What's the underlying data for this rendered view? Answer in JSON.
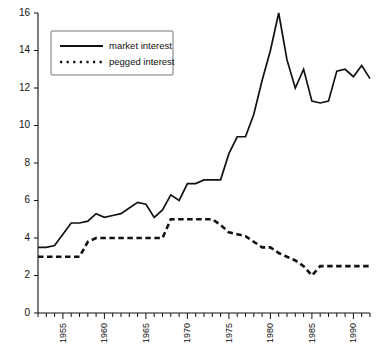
{
  "chart_data": {
    "type": "line",
    "title": "",
    "xlabel": "",
    "ylabel": "",
    "xlim": [
      1952,
      1992
    ],
    "ylim": [
      0,
      16
    ],
    "grid": false,
    "legend_position": "top-left",
    "y_ticks": [
      0,
      2,
      4,
      6,
      8,
      10,
      12,
      14,
      16
    ],
    "y_tick_labels": [
      "0",
      "2",
      "4",
      "6",
      "8",
      "10",
      "12",
      "14",
      "16"
    ],
    "x_tick_labels": [
      "1955",
      "1960",
      "1965",
      "1970",
      "1975",
      "1980",
      "1985",
      "1990"
    ],
    "x_tick_label_years": [
      1955,
      1960,
      1965,
      1970,
      1975,
      1980,
      1985,
      1990
    ],
    "x_minor_tick_years": [
      1952,
      1953,
      1954,
      1955,
      1956,
      1957,
      1958,
      1959,
      1960,
      1961,
      1962,
      1963,
      1964,
      1965,
      1966,
      1967,
      1968,
      1969,
      1970,
      1971,
      1972,
      1973,
      1974,
      1975,
      1976,
      1977,
      1978,
      1979,
      1980,
      1981,
      1982,
      1983,
      1984,
      1985,
      1986,
      1987,
      1988,
      1989,
      1990,
      1991,
      1992
    ],
    "x_tick_label_rotation": -90,
    "x": [
      1952,
      1953,
      1954,
      1955,
      1956,
      1957,
      1958,
      1959,
      1960,
      1961,
      1962,
      1963,
      1964,
      1965,
      1966,
      1967,
      1968,
      1969,
      1970,
      1971,
      1972,
      1973,
      1974,
      1975,
      1976,
      1977,
      1978,
      1979,
      1980,
      1981,
      1982,
      1983,
      1984,
      1985,
      1986,
      1987,
      1988,
      1989,
      1990,
      1991,
      1992
    ],
    "series": [
      {
        "name": "market interest",
        "style": "solid",
        "color": "#111111",
        "values": [
          3.5,
          3.5,
          3.6,
          4.2,
          4.8,
          4.8,
          4.9,
          5.3,
          5.1,
          5.2,
          5.3,
          5.6,
          5.9,
          5.8,
          5.1,
          5.5,
          6.3,
          6.0,
          6.9,
          6.9,
          7.1,
          7.1,
          7.1,
          8.5,
          9.4,
          9.4,
          10.6,
          12.4,
          14.0,
          16.0,
          13.5,
          12.0,
          13.0,
          11.3,
          11.2,
          11.3,
          12.9,
          13.0,
          12.6,
          13.2,
          12.5
        ]
      },
      {
        "name": "pegged interest",
        "style": "dotted",
        "color": "#111111",
        "values": [
          3.0,
          3.0,
          3.0,
          3.0,
          3.0,
          3.0,
          3.8,
          4.0,
          4.0,
          4.0,
          4.0,
          4.0,
          4.0,
          4.0,
          4.0,
          4.0,
          5.0,
          5.0,
          5.0,
          5.0,
          5.0,
          5.0,
          4.7,
          4.3,
          4.2,
          4.1,
          3.8,
          3.5,
          3.5,
          3.2,
          3.0,
          2.8,
          2.5,
          2.0,
          2.5,
          2.5,
          2.5,
          2.5,
          2.5,
          2.5,
          2.5
        ]
      }
    ]
  },
  "legend": {
    "items": [
      {
        "label": "market interest",
        "style": "solid"
      },
      {
        "label": "pegged interest",
        "style": "dotted"
      }
    ]
  }
}
